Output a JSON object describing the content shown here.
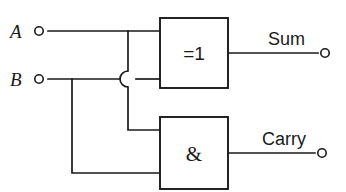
{
  "diagram": {
    "notation": "IEC rectangular gate symbols",
    "line_color": "#1a1a1a",
    "background_color": "#ffffff"
  },
  "inputs": [
    {
      "id": "input-a",
      "label": "A",
      "terminal_shape": "open-circle",
      "label_x": 10,
      "label_y": 38,
      "terminal_cx": 39,
      "terminal_cy": 31,
      "wire_y": 31
    },
    {
      "id": "input-b",
      "label": "B",
      "terminal_shape": "open-circle",
      "label_x": 10,
      "label_y": 86,
      "terminal_cx": 39,
      "terminal_cy": 79,
      "wire_y": 79
    }
  ],
  "gates": [
    {
      "id": "gate-xor",
      "type": "XOR",
      "symbol": "=1",
      "x": 160,
      "y": 18,
      "width": 68,
      "height": 70,
      "symbol_x": 194,
      "symbol_y": 59,
      "output": "Sum"
    },
    {
      "id": "gate-and",
      "type": "AND",
      "symbol": "&",
      "x": 160,
      "y": 117,
      "width": 68,
      "height": 72,
      "symbol_x": 194,
      "symbol_y": 160,
      "output": "Carry"
    }
  ],
  "outputs": [
    {
      "id": "output-sum",
      "label": "Sum",
      "terminal_shape": "open-circle",
      "label_x": 268,
      "label_y": 45,
      "terminal_cx": 325,
      "terminal_cy": 53,
      "wire_y": 53,
      "wire_x_start": 228
    },
    {
      "id": "output-carry",
      "label": "Carry",
      "terminal_shape": "open-circle",
      "label_x": 262,
      "label_y": 145,
      "terminal_cx": 322,
      "terminal_cy": 153,
      "wire_y": 153,
      "wire_x_start": 228
    }
  ],
  "junctions": [
    {
      "id": "junction-a-branch",
      "x": 128,
      "y": 31,
      "description": "A line splits toward AND gate"
    },
    {
      "id": "junction-b-branch",
      "x": 72,
      "y": 79,
      "description": "B line splits toward AND gate"
    }
  ],
  "crossing": {
    "id": "wire-hop",
    "x": 128,
    "y": 79,
    "radius": 8,
    "description": "A branch hops over B horizontal wire"
  },
  "wire_paths": {
    "a_to_xor": "M 48 31 L 160 31",
    "b_to_xor": "M 48 79 L 120 79 M 136 79 L 160 79",
    "a_branch_down_upper": "M 128 31 L 128 71",
    "a_branch_down_lower": "M 128 87 L 128 130 L 160 130",
    "b_branch_down": "M 72 79 L 72 173 L 160 173",
    "hop_arc": "M 128 71 A 8 8 0 0 0 128 87",
    "sum_out": "M 228 53 L 318 53",
    "carry_out": "M 228 153 L 315 153"
  }
}
